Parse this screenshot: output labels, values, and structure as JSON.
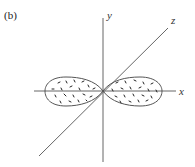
{
  "figure": {
    "panel_label": "(b)",
    "axes": {
      "x": {
        "label": "x"
      },
      "y": {
        "label": "y"
      },
      "z": {
        "label": "z"
      }
    },
    "colors": {
      "lines": "#555555",
      "dots": "#222222",
      "background": "#ffffff"
    }
  }
}
